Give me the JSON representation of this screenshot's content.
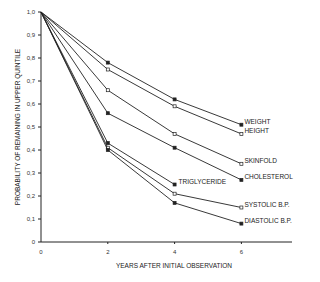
{
  "chart_data": {
    "type": "line",
    "title": "",
    "xlabel": "YEARS AFTER INITIAL OBSERVATION",
    "ylabel": "PROBABILITY OF REMAINING IN UPPER QUINTILE",
    "xlim": [
      0,
      8
    ],
    "ylim": [
      0,
      1.0
    ],
    "x_ticks": [
      "0",
      "2",
      "4",
      "6"
    ],
    "y_ticks": [
      "0",
      "0,1",
      "0,2",
      "0,3",
      "0,4",
      "0,5",
      "0,6",
      "0,7",
      "0,8",
      "0,9",
      "1,0"
    ],
    "grid": false,
    "legend": "inline labels at line ends",
    "series": [
      {
        "name": "WEIGHT",
        "marker": "filled",
        "x": [
          0,
          2,
          4,
          6
        ],
        "values": [
          1.0,
          0.78,
          0.62,
          0.51
        ]
      },
      {
        "name": "HEIGHT",
        "marker": "open",
        "x": [
          0,
          2,
          4,
          6
        ],
        "values": [
          1.0,
          0.75,
          0.59,
          0.47
        ]
      },
      {
        "name": "SKINFOLD",
        "marker": "open",
        "x": [
          0,
          2,
          4,
          6
        ],
        "values": [
          1.0,
          0.66,
          0.47,
          0.34
        ]
      },
      {
        "name": "CHOLESTEROL",
        "marker": "filled",
        "x": [
          0,
          2,
          4,
          6
        ],
        "values": [
          1.0,
          0.56,
          0.41,
          0.27
        ]
      },
      {
        "name": "TRIGLYCERIDE",
        "marker": "filled",
        "x": [
          0,
          2,
          4
        ],
        "values": [
          1.0,
          0.43,
          0.25
        ]
      },
      {
        "name": "SYSTOLIC B.P.",
        "marker": "open",
        "x": [
          0,
          2,
          4,
          6
        ],
        "values": [
          1.0,
          0.41,
          0.21,
          0.15
        ]
      },
      {
        "name": "DIASTOLIC B.P.",
        "marker": "filled",
        "x": [
          0,
          2,
          4,
          6
        ],
        "values": [
          1.0,
          0.4,
          0.17,
          0.08
        ]
      }
    ]
  }
}
